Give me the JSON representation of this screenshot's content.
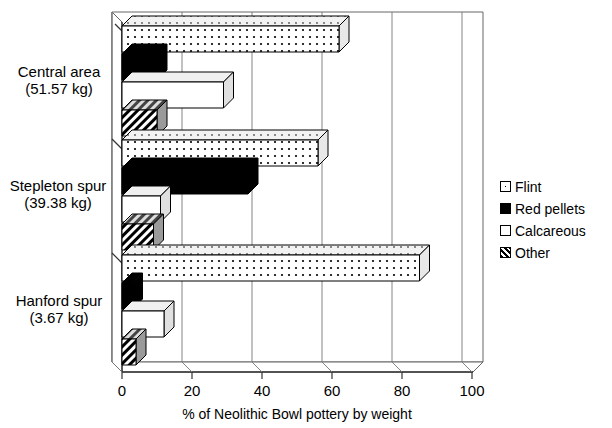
{
  "chart_data": {
    "type": "bar",
    "orientation": "horizontal",
    "style": "3d",
    "title": "",
    "xlabel": "% of Neolithic Bowl pottery by weight",
    "ylabel": "",
    "xlim": [
      0,
      100
    ],
    "xticks": [
      0,
      20,
      40,
      60,
      80,
      100
    ],
    "xtick_labels": [
      "0",
      "20",
      "40",
      "60",
      "80",
      "100"
    ],
    "grid": true,
    "grid_axis": "x",
    "legend_position": "right",
    "categories": [
      "Central area (51.57 kg)",
      "Stepleton spur (39.38 kg)",
      "Hanford spur (3.67 kg)"
    ],
    "category_lines": [
      {
        "name": "Central area",
        "weight": "(51.57 kg)"
      },
      {
        "name": "Stepleton spur",
        "weight": "(39.38 kg)"
      },
      {
        "name": "Hanford spur",
        "weight": "(3.67 kg)"
      }
    ],
    "series": [
      {
        "name": "Flint",
        "fill": "dotted",
        "values": [
          62,
          56,
          85
        ]
      },
      {
        "name": "Red pellets",
        "fill": "solid-black",
        "values": [
          10,
          36,
          3
        ]
      },
      {
        "name": "Calcareous",
        "fill": "white",
        "values": [
          29,
          11,
          12
        ]
      },
      {
        "name": "Other",
        "fill": "hatched",
        "values": [
          10,
          9,
          4
        ]
      }
    ]
  },
  "legend": {
    "items": [
      {
        "label": "Flint",
        "fill": "dotted"
      },
      {
        "label": "Red pellets",
        "fill": "solid-black"
      },
      {
        "label": "Calcareous",
        "fill": "white"
      },
      {
        "label": "Other",
        "fill": "hatched"
      }
    ]
  },
  "axis": {
    "x_title": "% of Neolithic Bowl pottery by weight",
    "ticks": [
      "0",
      "20",
      "40",
      "60",
      "80",
      "100"
    ]
  },
  "categories": [
    {
      "line1": "Central area",
      "line2": "(51.57 kg)"
    },
    {
      "line1": "Stepleton spur",
      "line2": "(39.38 kg)"
    },
    {
      "line1": "Hanford spur",
      "line2": "(3.67 kg)"
    }
  ]
}
